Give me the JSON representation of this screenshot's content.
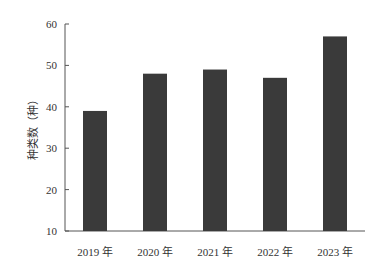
{
  "chart_data": {
    "type": "bar",
    "title": "",
    "xlabel": "",
    "ylabel": "种类数（种）",
    "categories": [
      "2019 年",
      "2020 年",
      "2021 年",
      "2022 年",
      "2023 年"
    ],
    "values": [
      39,
      48,
      49,
      47,
      57
    ],
    "ylim": [
      10,
      60
    ],
    "yticks": [
      10,
      20,
      30,
      40,
      50,
      60
    ],
    "grid": false,
    "legend": null,
    "bar_color": "#3a3a3a",
    "axis_color": "#555555"
  }
}
